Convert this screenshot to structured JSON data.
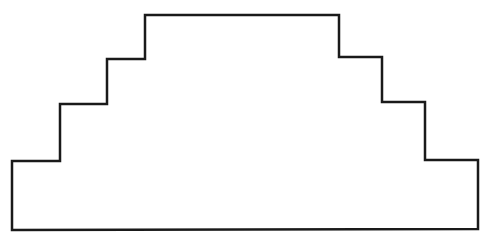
{
  "diagram": {
    "stroke_color": "#1a1a1a",
    "fill_color": "#ffffff",
    "stroke_width": 2.5,
    "outline_points": [
      [
        12,
        230
      ],
      [
        12,
        161
      ],
      [
        60,
        161
      ],
      [
        60,
        104
      ],
      [
        107,
        104
      ],
      [
        107,
        59
      ],
      [
        145,
        59
      ],
      [
        145,
        15
      ],
      [
        339,
        15
      ],
      [
        339,
        57
      ],
      [
        382,
        57
      ],
      [
        382,
        102
      ],
      [
        425,
        102
      ],
      [
        425,
        160
      ],
      [
        478,
        160
      ],
      [
        478,
        229
      ]
    ],
    "steps_per_side": 3
  }
}
